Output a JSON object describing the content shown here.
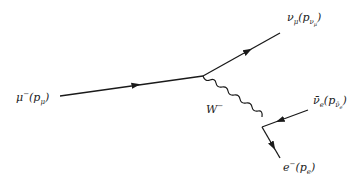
{
  "diagram": {
    "type": "feynman",
    "colors": {
      "line": "#1a1a1a",
      "background": "#ffffff"
    },
    "vertices": [
      {
        "id": "v1",
        "x": 203,
        "y": 76
      },
      {
        "id": "v2",
        "x": 262,
        "y": 127
      }
    ],
    "particles": [
      {
        "id": "muon",
        "kind": "fermion-in",
        "from": [
          60,
          96
        ],
        "to": "v1",
        "label": "μ⁻(p_μ)"
      },
      {
        "id": "nu_mu",
        "kind": "fermion-out",
        "from": "v1",
        "to": [
          280,
          33
        ],
        "label": "ν_μ(p_ν_μ)"
      },
      {
        "id": "W",
        "kind": "boson",
        "from": "v1",
        "to": "v2",
        "label": "W⁻"
      },
      {
        "id": "nubar_e",
        "kind": "antifermion",
        "from": [
          308,
          110
        ],
        "to": "v2",
        "label": "ν̄_e(p_ν̄_e)"
      },
      {
        "id": "electron",
        "kind": "fermion-out",
        "from": "v2",
        "to": [
          280,
          158
        ],
        "label": "e⁻(p_e)"
      }
    ]
  },
  "labels": {
    "muon": {
      "base": "μ",
      "sup": "−",
      "arg": "p",
      "argsub": "μ"
    },
    "nu_mu": {
      "base": "ν",
      "sub": "μ",
      "arg": "p",
      "argsub": "ν",
      "argsub2": "μ"
    },
    "W": {
      "base": "W",
      "sup": "−"
    },
    "nubar_e": {
      "base": "ν̄",
      "sub": "e",
      "arg": "p",
      "argsub": "ν̄",
      "argsub2": "e"
    },
    "electron": {
      "base": "e",
      "sup": "−",
      "arg": "p",
      "argsub": "e"
    }
  },
  "punct": {
    "open": "(",
    "close": ")"
  }
}
